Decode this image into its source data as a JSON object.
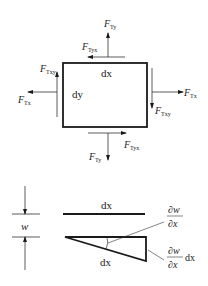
{
  "element_diagram": {
    "rectangle_labels": {
      "width": "dx",
      "height": "dy"
    },
    "forces": {
      "top_vertical": {
        "base": "F",
        "sub": "Ty"
      },
      "top_horizontal": {
        "base": "F",
        "sub": "Tyx"
      },
      "left_vertical": {
        "base": "F",
        "sub": "Txy"
      },
      "left_horizontal": {
        "base": "F",
        "sub": "Tx"
      },
      "right_horizontal": {
        "base": "F",
        "sub": "Tx"
      },
      "right_vertical": {
        "base": "F",
        "sub": "Txy"
      },
      "bottom_horizontal": {
        "base": "F",
        "sub": "Tyx"
      },
      "bottom_vertical": {
        "base": "F",
        "sub": "Ty"
      }
    }
  },
  "deflection_diagram": {
    "dimension_label": "w",
    "top_line_label": "dx",
    "hypotenuse_label": "dx",
    "angle_label": {
      "num": "∂w",
      "den": "∂x"
    },
    "vertical_label": {
      "num": "∂w",
      "den": "∂x",
      "suffix": "dx"
    }
  },
  "colors": {
    "line": "#1a1a1a",
    "thin_line": "#333333",
    "background": "#ffffff"
  }
}
